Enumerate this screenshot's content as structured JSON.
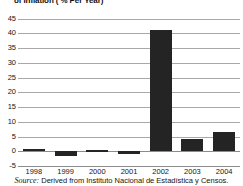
{
  "title": "of Inflation ( % Per Year)",
  "source": {
    "label": "Source:",
    "text": "Derived from Instituto Nacional de Estadística y Censos."
  },
  "colors": {
    "bar": "#242424",
    "gridline": "#a8a8a8",
    "axis": "#8c8c8c",
    "background": "#ffffff"
  },
  "axis": {
    "y_ticks": [
      "45",
      "40",
      "35",
      "30",
      "25",
      "20",
      "15",
      "10",
      "5",
      "0",
      "-5"
    ],
    "x_ticks": [
      "1998",
      "1999",
      "2000",
      "2001",
      "2002",
      "2003",
      "2004"
    ]
  },
  "chart_data": {
    "type": "bar",
    "title": "of Inflation ( % Per Year)",
    "xlabel": "",
    "ylabel": "",
    "categories": [
      "1998",
      "1999",
      "2000",
      "2001",
      "2002",
      "2003",
      "2004"
    ],
    "values": [
      0.7,
      -1.5,
      0.3,
      -1.1,
      41,
      4,
      6.5
    ],
    "ylim": [
      -5,
      45
    ],
    "ytick_step": 5,
    "grid": true,
    "legend": false,
    "bar_color": "#242424",
    "source": "Source: Derived from Instituto Nacional de Estadística y Censos."
  }
}
